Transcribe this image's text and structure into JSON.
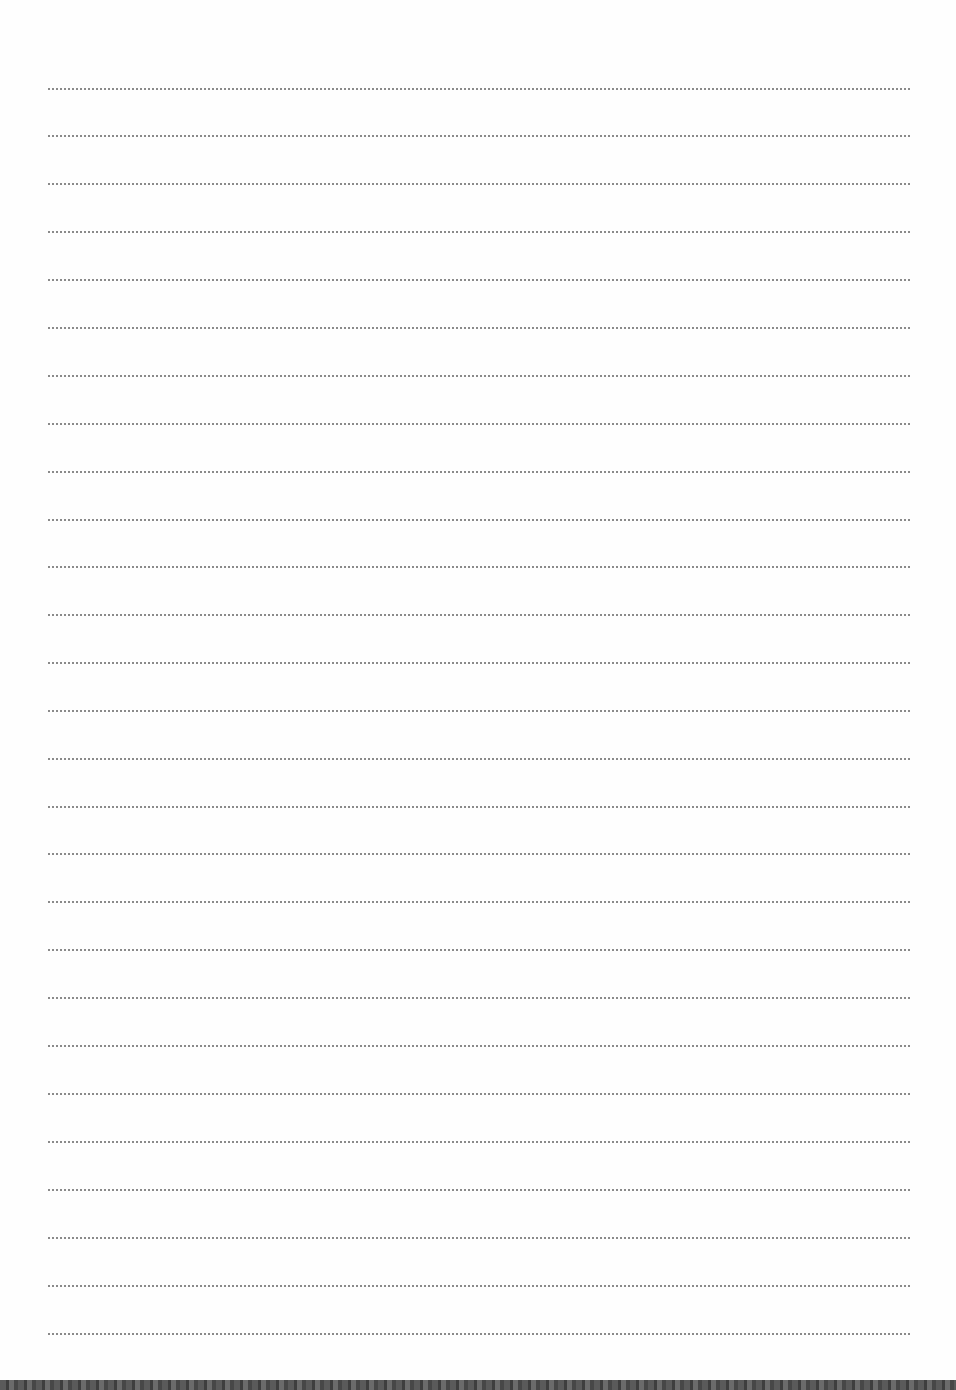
{
  "page": {
    "type": "ruled-writing-sheet",
    "line_count": 27,
    "line_style": "dotted",
    "line_color": "#8a8a8a",
    "background_color": "#fefefe",
    "bottom_edge_color": "#4a4a4a"
  },
  "lines": [
    {
      "y": 88
    },
    {
      "y": 135
    },
    {
      "y": 183
    },
    {
      "y": 231
    },
    {
      "y": 279
    },
    {
      "y": 327
    },
    {
      "y": 375
    },
    {
      "y": 423
    },
    {
      "y": 471
    },
    {
      "y": 519
    },
    {
      "y": 566
    },
    {
      "y": 614
    },
    {
      "y": 662
    },
    {
      "y": 710
    },
    {
      "y": 758
    },
    {
      "y": 806
    },
    {
      "y": 853
    },
    {
      "y": 901
    },
    {
      "y": 949
    },
    {
      "y": 997
    },
    {
      "y": 1045
    },
    {
      "y": 1093
    },
    {
      "y": 1141
    },
    {
      "y": 1189
    },
    {
      "y": 1237
    },
    {
      "y": 1285
    },
    {
      "y": 1333
    }
  ]
}
